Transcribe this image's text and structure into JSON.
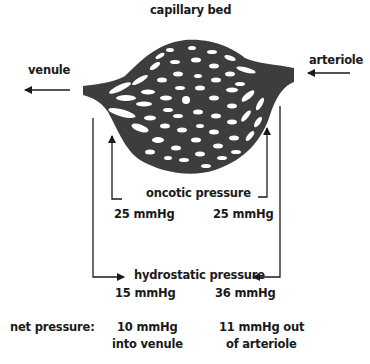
{
  "title": "capillary bed",
  "labels": {
    "venule": "venule",
    "arteriole": "arteriole",
    "oncotic": "oncotic pressure",
    "hydrostatic": "hydrostatic pressure",
    "net": "net pressure:"
  },
  "oncotic_values": {
    "venule_side": "25 mmHg",
    "arteriole_side": "25 mmHg"
  },
  "hydrostatic_values": {
    "venule_side": "15 mmHg",
    "arteriole_side": "36 mmHg"
  },
  "net_values": {
    "venule_side_line1": "10 mmHg",
    "venule_side_line2": "into venule",
    "arteriole_side_line1": "11 mmHg out",
    "arteriole_side_line2": "of arteriole"
  },
  "colors": {
    "vessel": "#3d3d3d",
    "line": "#1a1a1a",
    "background": "#ffffff"
  }
}
